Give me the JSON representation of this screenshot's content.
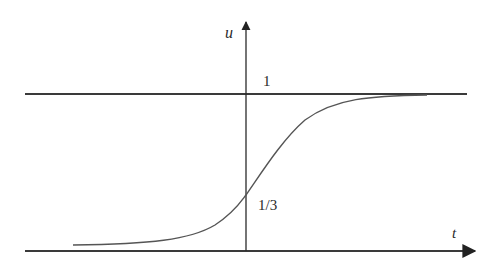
{
  "diagram": {
    "type": "function-plot",
    "axes": {
      "horizontal": {
        "label": "t"
      },
      "vertical": {
        "label": "u"
      }
    },
    "asymptotes": [
      {
        "name": "upper",
        "value_label": "1"
      },
      {
        "name": "lower",
        "value_label": ""
      }
    ],
    "annotations": {
      "upper_level": "1",
      "intercept": "1/3"
    },
    "colors": {
      "line": "#3a3a3a",
      "curve": "#555555",
      "text": "#2a2a2a"
    }
  }
}
